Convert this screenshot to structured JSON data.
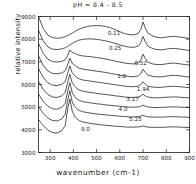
{
  "chart_data": {
    "type": "line",
    "title": "pH = 8.4 - 8.5",
    "xlabel": "wavenumber (cm-1)",
    "ylabel": "relative intensity",
    "xlim": [
      250,
      900
    ],
    "ylim": [
      3000,
      9000
    ],
    "xticks": [
      300,
      400,
      500,
      600,
      700,
      800,
      900
    ],
    "yticks": [
      3000,
      4000,
      5000,
      6000,
      7000,
      8000,
      9000
    ],
    "grid": false,
    "legend_position": "inline-curve-labels",
    "x": [
      250,
      270,
      290,
      310,
      330,
      350,
      365,
      375,
      385,
      395,
      405,
      415,
      425,
      440,
      460,
      480,
      500,
      520,
      540,
      560,
      580,
      600,
      620,
      640,
      660,
      680,
      690,
      700,
      710,
      720,
      740,
      760,
      780,
      800,
      820,
      840,
      860,
      880,
      900
    ],
    "series": [
      {
        "name": "0.11",
        "label": "0.11",
        "label_x": 575,
        "label_y": 8180,
        "values": [
          9000,
          8480,
          8180,
          8070,
          8040,
          8060,
          8110,
          8160,
          8210,
          8270,
          8330,
          8390,
          8440,
          8500,
          8560,
          8590,
          8600,
          8590,
          8560,
          8500,
          8420,
          8330,
          8250,
          8200,
          8190,
          8260,
          8420,
          8760,
          8480,
          8280,
          8150,
          8080,
          8060,
          8090,
          8120,
          8120,
          8090,
          8060,
          8030
        ]
      },
      {
        "name": "0.25",
        "label": "0.25",
        "label_x": 580,
        "label_y": 7520,
        "values": [
          8400,
          7930,
          7660,
          7560,
          7540,
          7570,
          7620,
          7680,
          7740,
          7810,
          7870,
          7920,
          7960,
          7990,
          8010,
          8010,
          7990,
          7960,
          7920,
          7870,
          7810,
          7750,
          7690,
          7650,
          7640,
          7700,
          7840,
          8120,
          7880,
          7700,
          7590,
          7540,
          7530,
          7560,
          7590,
          7590,
          7560,
          7530,
          7500
        ]
      },
      {
        "name": "0.52",
        "label": "0.52",
        "label_x": 690,
        "label_y": 6860,
        "values": [
          7820,
          7380,
          7120,
          7010,
          6990,
          7020,
          7090,
          7260,
          7530,
          7420,
          7380,
          7330,
          7290,
          7260,
          7240,
          7220,
          7190,
          7160,
          7120,
          7080,
          7030,
          6990,
          6950,
          6920,
          6910,
          6960,
          7080,
          7340,
          7140,
          6990,
          6910,
          6880,
          6880,
          6910,
          6940,
          6940,
          6910,
          6880,
          6860
        ]
      },
      {
        "name": "1.0",
        "label": "1.0",
        "label_x": 608,
        "label_y": 6300,
        "values": [
          7260,
          6850,
          6600,
          6490,
          6470,
          6510,
          6600,
          6860,
          7160,
          6940,
          6850,
          6780,
          6720,
          6680,
          6650,
          6620,
          6590,
          6560,
          6530,
          6490,
          6450,
          6410,
          6380,
          6350,
          6340,
          6380,
          6470,
          6680,
          6530,
          6420,
          6360,
          6340,
          6340,
          6370,
          6400,
          6400,
          6380,
          6350,
          6330
        ]
      },
      {
        "name": "1.94",
        "label": "1.94",
        "label_x": 700,
        "label_y": 5720,
        "values": [
          6700,
          6320,
          6080,
          5970,
          5950,
          6010,
          6130,
          6480,
          6820,
          6520,
          6400,
          6310,
          6250,
          6200,
          6170,
          6140,
          6110,
          6080,
          6050,
          6020,
          5990,
          5960,
          5930,
          5910,
          5900,
          5930,
          5990,
          6120,
          6010,
          5930,
          5890,
          5870,
          5880,
          5900,
          5920,
          5920,
          5900,
          5880,
          5860
        ]
      },
      {
        "name": "3.17",
        "label": "3.17",
        "label_x": 655,
        "label_y": 5280,
        "values": [
          6140,
          5790,
          5560,
          5450,
          5430,
          5500,
          5650,
          6080,
          6450,
          6080,
          5930,
          5830,
          5760,
          5710,
          5670,
          5640,
          5610,
          5580,
          5560,
          5530,
          5500,
          5480,
          5450,
          5430,
          5430,
          5450,
          5490,
          5570,
          5500,
          5450,
          5420,
          5410,
          5420,
          5440,
          5450,
          5450,
          5440,
          5420,
          5410
        ]
      },
      {
        "name": "4.0",
        "label": "4.0",
        "label_x": 614,
        "label_y": 4830,
        "values": [
          5580,
          5260,
          5040,
          4930,
          4910,
          4990,
          5170,
          5680,
          6080,
          5660,
          5480,
          5370,
          5300,
          5250,
          5210,
          5180,
          5150,
          5130,
          5100,
          5080,
          5060,
          5040,
          5020,
          5000,
          5000,
          5010,
          5040,
          5090,
          5040,
          5010,
          4990,
          4980,
          4990,
          5000,
          5010,
          5010,
          5000,
          4990,
          4980
        ]
      },
      {
        "name": "5.25",
        "label": "5.25",
        "label_x": 668,
        "label_y": 4390,
        "values": [
          5020,
          4730,
          4520,
          4410,
          4390,
          4480,
          4690,
          5280,
          5720,
          5240,
          5040,
          4930,
          4860,
          4800,
          4760,
          4730,
          4700,
          4680,
          4660,
          4640,
          4620,
          4600,
          4590,
          4570,
          4570,
          4580,
          4600,
          4640,
          4600,
          4580,
          4560,
          4560,
          4560,
          4570,
          4580,
          4580,
          4570,
          4560,
          4550
        ]
      },
      {
        "name": "9.0",
        "label": "9.0",
        "label_x": 452,
        "label_y": 3930,
        "values": [
          4460,
          4200,
          3990,
          3880,
          3860,
          3960,
          4200,
          4880,
          5360,
          4830,
          4610,
          4490,
          4410,
          4350,
          4310,
          4270,
          4250,
          4220,
          4200,
          4180,
          4160,
          4150,
          4130,
          4120,
          4120,
          4130,
          4140,
          4170,
          4140,
          4120,
          4110,
          4110,
          4110,
          4120,
          4130,
          4130,
          4120,
          4110,
          4100
        ]
      }
    ]
  }
}
